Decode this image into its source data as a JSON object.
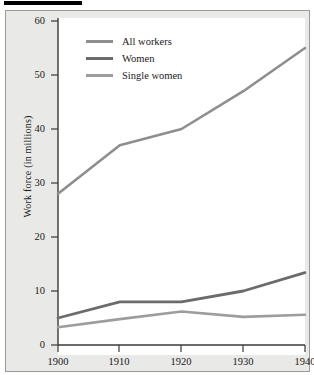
{
  "chart_data": {
    "type": "line",
    "title": "",
    "xlabel": "",
    "ylabel": "Work force (in millions)",
    "x": [
      1900,
      1910,
      1920,
      1930,
      1940
    ],
    "xticklabels": [
      "1900",
      "1910",
      "1920",
      "1930",
      "1940"
    ],
    "yticklabels": [
      "0",
      "10",
      "20",
      "30",
      "40",
      "50",
      "60"
    ],
    "yticks": [
      0,
      10,
      20,
      30,
      40,
      50,
      60
    ],
    "xlim": [
      1900,
      1940
    ],
    "ylim": [
      0,
      62
    ],
    "grid": false,
    "legend_position": "upper-left-inside",
    "series": [
      {
        "name": "All workers",
        "color": "#8e8e8e",
        "values": [
          28,
          37,
          40,
          47,
          55
        ]
      },
      {
        "name": "Women",
        "color": "#6b6b6b",
        "values": [
          5,
          8,
          8,
          10,
          13.4
        ]
      },
      {
        "name": "Single women",
        "color": "#9d9d9d",
        "values": [
          3.3,
          4.8,
          6.2,
          5.2,
          5.6
        ]
      }
    ]
  },
  "figure": {
    "panel_background": "#e9e9e7",
    "plot_background": "#ffffff",
    "axis_color": "#3a3a3a",
    "top_rule_color": "#000000"
  }
}
